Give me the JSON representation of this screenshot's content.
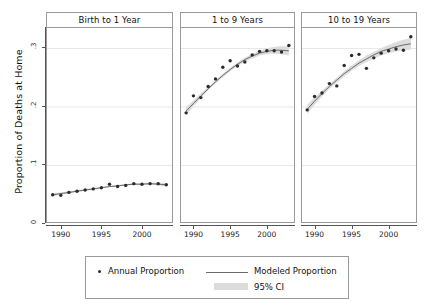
{
  "chart_data": {
    "type": "line",
    "title": "",
    "xlabel": "",
    "ylabel": "Proportion of Deaths at Home",
    "xlim": [
      1988.3,
      2003.7
    ],
    "ylim": [
      0,
      0.335
    ],
    "xticks": [
      1990,
      1995,
      2000
    ],
    "yticks": [
      0,
      0.1,
      0.2,
      0.3
    ],
    "ytick_labels": [
      "0",
      ".1",
      ".2",
      ".3"
    ],
    "xtick_labels": [
      "1990",
      "1995",
      "2000"
    ],
    "grid": "horizontal",
    "legend_position": "bottom",
    "facets": [
      {
        "title": "Birth to 1 Year",
        "x": [
          1989,
          1990,
          1991,
          1992,
          1993,
          1994,
          1995,
          1996,
          1997,
          1998,
          1999,
          2000,
          2001,
          2002,
          2003
        ],
        "annual_proportion": [
          0.05,
          0.049,
          0.054,
          0.056,
          0.058,
          0.06,
          0.062,
          0.068,
          0.064,
          0.066,
          0.069,
          0.068,
          0.069,
          0.069,
          0.067
        ],
        "modeled_proportion": [
          0.05,
          0.052,
          0.054,
          0.056,
          0.058,
          0.06,
          0.062,
          0.064,
          0.065,
          0.067,
          0.068,
          0.068,
          0.069,
          0.068,
          0.067
        ],
        "ci_lower": [
          0.047,
          0.05,
          0.052,
          0.055,
          0.057,
          0.059,
          0.061,
          0.063,
          0.064,
          0.066,
          0.067,
          0.067,
          0.067,
          0.066,
          0.064
        ],
        "ci_upper": [
          0.053,
          0.054,
          0.056,
          0.058,
          0.06,
          0.062,
          0.063,
          0.065,
          0.067,
          0.068,
          0.07,
          0.07,
          0.071,
          0.071,
          0.07
        ]
      },
      {
        "title": "1 to 9 Years",
        "x": [
          1989,
          1990,
          1991,
          1992,
          1993,
          1994,
          1995,
          1996,
          1997,
          1998,
          1999,
          2000,
          2001,
          2002,
          2003
        ],
        "annual_proportion": [
          0.19,
          0.219,
          0.216,
          0.235,
          0.248,
          0.268,
          0.279,
          0.27,
          0.277,
          0.289,
          0.295,
          0.296,
          0.296,
          0.294,
          0.305
        ],
        "modeled_proportion": [
          0.193,
          0.206,
          0.219,
          0.231,
          0.243,
          0.254,
          0.264,
          0.273,
          0.281,
          0.287,
          0.292,
          0.295,
          0.297,
          0.297,
          0.296
        ],
        "ci_lower": [
          0.186,
          0.201,
          0.215,
          0.228,
          0.24,
          0.251,
          0.261,
          0.27,
          0.277,
          0.283,
          0.288,
          0.29,
          0.291,
          0.29,
          0.288
        ],
        "ci_upper": [
          0.2,
          0.211,
          0.223,
          0.234,
          0.246,
          0.257,
          0.267,
          0.276,
          0.284,
          0.291,
          0.296,
          0.3,
          0.303,
          0.304,
          0.304
        ]
      },
      {
        "title": "10 to 19 Years",
        "x": [
          1989,
          1990,
          1991,
          1992,
          1993,
          1994,
          1995,
          1996,
          1997,
          1998,
          1999,
          2000,
          2001,
          2002,
          2003
        ],
        "annual_proportion": [
          0.195,
          0.218,
          0.224,
          0.24,
          0.236,
          0.271,
          0.288,
          0.29,
          0.266,
          0.284,
          0.292,
          0.296,
          0.299,
          0.297,
          0.32
        ],
        "modeled_proportion": [
          0.196,
          0.21,
          0.223,
          0.235,
          0.246,
          0.257,
          0.266,
          0.275,
          0.282,
          0.289,
          0.295,
          0.299,
          0.303,
          0.306,
          0.308
        ],
        "ci_lower": [
          0.188,
          0.204,
          0.218,
          0.231,
          0.242,
          0.252,
          0.262,
          0.27,
          0.277,
          0.283,
          0.288,
          0.292,
          0.295,
          0.297,
          0.298
        ],
        "ci_upper": [
          0.204,
          0.216,
          0.228,
          0.239,
          0.25,
          0.261,
          0.271,
          0.28,
          0.288,
          0.294,
          0.301,
          0.306,
          0.311,
          0.315,
          0.318
        ]
      }
    ],
    "legend": [
      {
        "label": "Annual Proportion",
        "marker": "dot",
        "color": "#2b2b2b"
      },
      {
        "label": "Modeled Proportion",
        "marker": "line",
        "color": "#6b6b6b"
      },
      {
        "label": "95% CI",
        "marker": "band",
        "color": "#dcdcdc"
      }
    ],
    "colors": {
      "point": "#2b2b2b",
      "line": "#6b6b6b",
      "ci_band": "#dcdcdc",
      "axis": "#555555",
      "frame": "#9a9a9a",
      "gridline": "#e8e8e8",
      "background": "#ffffff"
    }
  }
}
